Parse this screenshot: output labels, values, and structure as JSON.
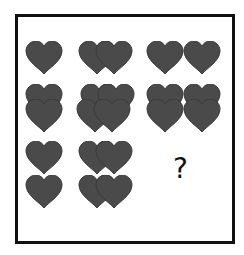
{
  "puzzle": {
    "question_mark": "?",
    "heart_color": "#4a4a4a",
    "heart_edge": "#333333",
    "grid": [
      [
        {
          "cell": "r1c1",
          "description": "1 heart"
        },
        {
          "cell": "r1c2",
          "description": "2 hearts overlapping horizontally"
        },
        {
          "cell": "r1c3",
          "description": "2 hearts side by side"
        }
      ],
      [
        {
          "cell": "r2c1",
          "description": "2 hearts overlapping vertically"
        },
        {
          "cell": "r2c2",
          "description": "4 hearts overlapping"
        },
        {
          "cell": "r2c3",
          "description": "2x2 hearts overlapping vertically"
        }
      ],
      [
        {
          "cell": "r3c1",
          "description": "2 hearts stacked vertically"
        },
        {
          "cell": "r3c2",
          "description": "2 pairs of overlapping hearts stacked"
        },
        {
          "cell": "r3c3",
          "description": "missing (?)"
        }
      ]
    ]
  }
}
